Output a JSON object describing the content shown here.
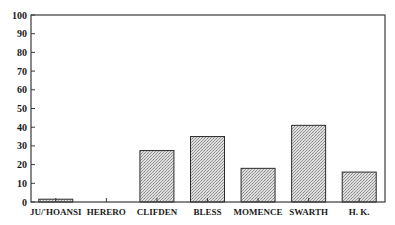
{
  "chart_data": {
    "type": "bar",
    "title": "",
    "xlabel": "",
    "ylabel": "",
    "categories": [
      "JU/'HOANSI",
      "HERERO",
      "CLIFDEN",
      "BLESS",
      "MOMENCE",
      "SWARTH",
      "H. K."
    ],
    "values": [
      1.5,
      0,
      27.5,
      35,
      18,
      41,
      16
    ],
    "ylim": [
      0,
      100
    ],
    "yticks": [
      0,
      10,
      20,
      30,
      40,
      50,
      60,
      70,
      80,
      90,
      100
    ],
    "grid": false,
    "legend": null,
    "bar_fill": "stippled gray",
    "colors": {
      "bar_fill": "#cfcfcf",
      "bar_stroke": "#2a2a2a",
      "axis": "#3a3a3a"
    }
  }
}
